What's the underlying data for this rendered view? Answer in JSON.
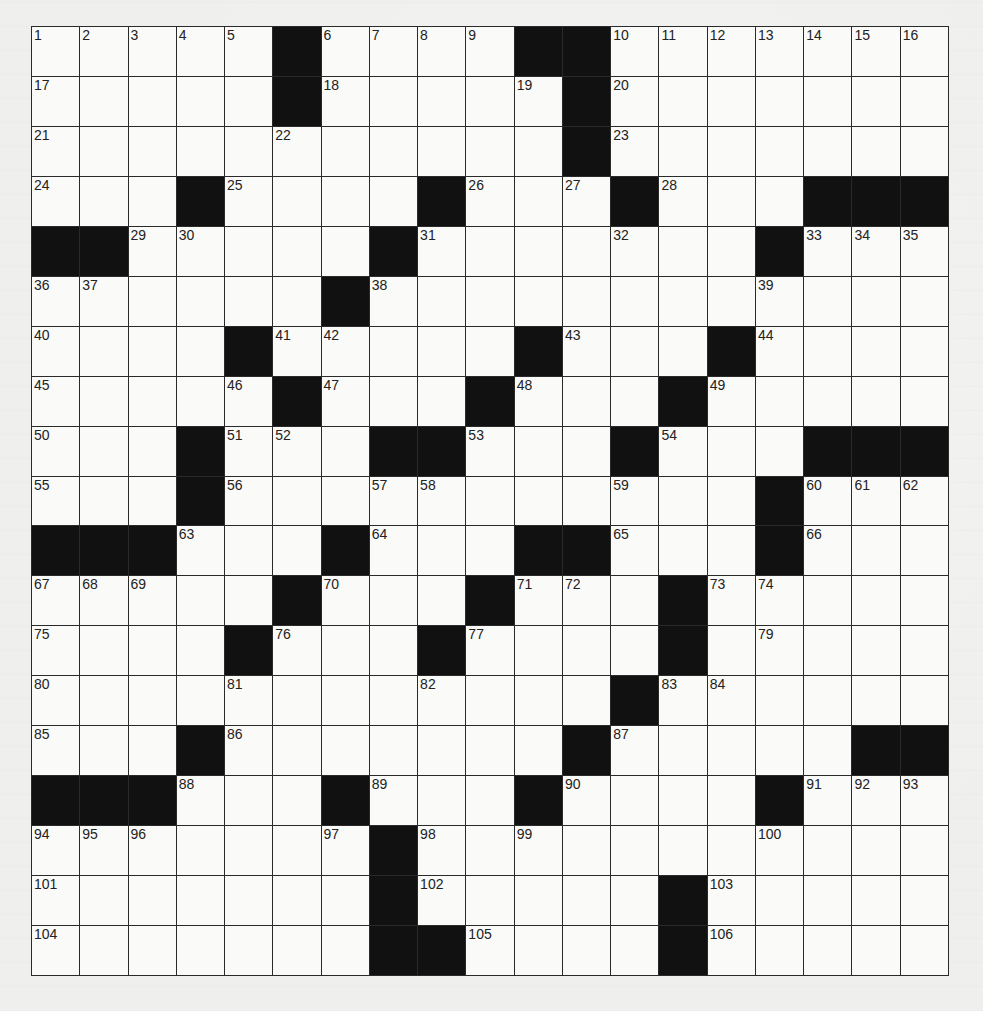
{
  "puzzle": {
    "rows": 19,
    "cols": 19,
    "colors": {
      "black": "#111111",
      "white": "#fafaf8",
      "line": "#2a2a2a"
    },
    "layout": [
      ".....#....##.......",
      ".....#.....#.......",
      "...........#.......",
      "...#....#...#...###",
      "##.....#.......#...",
      "......#............",
      "....#.....#...#....",
      ".....#...#...#.....",
      "...#...##...#...###",
      "...#...........#...",
      "###...#...##...#...",
      ".....#...#...#.....",
      "....#...#....#.....",
      "............#......",
      "...#.......#.....##",
      "###...#...#....#...",
      ".......#...........",
      ".......#.....#.....",
      ".......##....#....."
    ],
    "numbers": [
      {
        "r": 0,
        "c": 0,
        "n": 1
      },
      {
        "r": 0,
        "c": 1,
        "n": 2
      },
      {
        "r": 0,
        "c": 2,
        "n": 3
      },
      {
        "r": 0,
        "c": 3,
        "n": 4
      },
      {
        "r": 0,
        "c": 4,
        "n": 5
      },
      {
        "r": 0,
        "c": 6,
        "n": 6
      },
      {
        "r": 0,
        "c": 7,
        "n": 7
      },
      {
        "r": 0,
        "c": 8,
        "n": 8
      },
      {
        "r": 0,
        "c": 9,
        "n": 9
      },
      {
        "r": 0,
        "c": 12,
        "n": 10
      },
      {
        "r": 0,
        "c": 13,
        "n": 11
      },
      {
        "r": 0,
        "c": 14,
        "n": 12
      },
      {
        "r": 0,
        "c": 15,
        "n": 13
      },
      {
        "r": 0,
        "c": 16,
        "n": 14
      },
      {
        "r": 0,
        "c": 17,
        "n": 15
      },
      {
        "r": 0,
        "c": 18,
        "n": 16
      },
      {
        "r": 1,
        "c": 0,
        "n": 17
      },
      {
        "r": 1,
        "c": 6,
        "n": 18
      },
      {
        "r": 1,
        "c": 10,
        "n": 19
      },
      {
        "r": 1,
        "c": 12,
        "n": 20
      },
      {
        "r": 2,
        "c": 0,
        "n": 21
      },
      {
        "r": 2,
        "c": 5,
        "n": 22
      },
      {
        "r": 2,
        "c": 12,
        "n": 23
      },
      {
        "r": 3,
        "c": 0,
        "n": 24
      },
      {
        "r": 3,
        "c": 4,
        "n": 25
      },
      {
        "r": 3,
        "c": 9,
        "n": 26
      },
      {
        "r": 3,
        "c": 11,
        "n": 27
      },
      {
        "r": 3,
        "c": 13,
        "n": 28
      },
      {
        "r": 4,
        "c": 2,
        "n": 29
      },
      {
        "r": 4,
        "c": 3,
        "n": 30
      },
      {
        "r": 4,
        "c": 8,
        "n": 31
      },
      {
        "r": 4,
        "c": 12,
        "n": 32
      },
      {
        "r": 4,
        "c": 16,
        "n": 33
      },
      {
        "r": 4,
        "c": 17,
        "n": 34
      },
      {
        "r": 4,
        "c": 18,
        "n": 35
      },
      {
        "r": 5,
        "c": 0,
        "n": 36
      },
      {
        "r": 5,
        "c": 1,
        "n": 37
      },
      {
        "r": 5,
        "c": 7,
        "n": 38
      },
      {
        "r": 5,
        "c": 15,
        "n": 39
      },
      {
        "r": 6,
        "c": 0,
        "n": 40
      },
      {
        "r": 6,
        "c": 5,
        "n": 41
      },
      {
        "r": 6,
        "c": 6,
        "n": 42
      },
      {
        "r": 6,
        "c": 11,
        "n": 43
      },
      {
        "r": 6,
        "c": 15,
        "n": 44
      },
      {
        "r": 7,
        "c": 0,
        "n": 45
      },
      {
        "r": 7,
        "c": 4,
        "n": 46
      },
      {
        "r": 7,
        "c": 6,
        "n": 47
      },
      {
        "r": 7,
        "c": 10,
        "n": 48
      },
      {
        "r": 7,
        "c": 14,
        "n": 49
      },
      {
        "r": 8,
        "c": 0,
        "n": 50
      },
      {
        "r": 8,
        "c": 4,
        "n": 51
      },
      {
        "r": 8,
        "c": 5,
        "n": 52
      },
      {
        "r": 8,
        "c": 9,
        "n": 53
      },
      {
        "r": 8,
        "c": 13,
        "n": 54
      },
      {
        "r": 9,
        "c": 0,
        "n": 55
      },
      {
        "r": 9,
        "c": 4,
        "n": 56
      },
      {
        "r": 9,
        "c": 7,
        "n": 57
      },
      {
        "r": 9,
        "c": 8,
        "n": 58
      },
      {
        "r": 9,
        "c": 12,
        "n": 59
      },
      {
        "r": 9,
        "c": 16,
        "n": 60
      },
      {
        "r": 9,
        "c": 17,
        "n": 61
      },
      {
        "r": 9,
        "c": 18,
        "n": 62
      },
      {
        "r": 10,
        "c": 3,
        "n": 63
      },
      {
        "r": 10,
        "c": 7,
        "n": 64
      },
      {
        "r": 10,
        "c": 12,
        "n": 65
      },
      {
        "r": 10,
        "c": 16,
        "n": 66
      },
      {
        "r": 11,
        "c": 0,
        "n": 67
      },
      {
        "r": 11,
        "c": 1,
        "n": 68
      },
      {
        "r": 11,
        "c": 2,
        "n": 69
      },
      {
        "r": 11,
        "c": 6,
        "n": 70
      },
      {
        "r": 11,
        "c": 10,
        "n": 71
      },
      {
        "r": 11,
        "c": 11,
        "n": 72
      },
      {
        "r": 11,
        "c": 14,
        "n": 73
      },
      {
        "r": 11,
        "c": 15,
        "n": 74
      },
      {
        "r": 12,
        "c": 0,
        "n": 75
      },
      {
        "r": 12,
        "c": 5,
        "n": 76
      },
      {
        "r": 12,
        "c": 9,
        "n": 77
      },
      {
        "r": 12,
        "c": 13,
        "n": 78
      },
      {
        "r": 12,
        "c": 15,
        "n": 79
      },
      {
        "r": 13,
        "c": 0,
        "n": 80
      },
      {
        "r": 13,
        "c": 4,
        "n": 81
      },
      {
        "r": 13,
        "c": 8,
        "n": 82
      },
      {
        "r": 13,
        "c": 13,
        "n": 83
      },
      {
        "r": 13,
        "c": 14,
        "n": 84
      },
      {
        "r": 14,
        "c": 0,
        "n": 85
      },
      {
        "r": 14,
        "c": 4,
        "n": 86
      },
      {
        "r": 14,
        "c": 12,
        "n": 87
      },
      {
        "r": 15,
        "c": 3,
        "n": 88
      },
      {
        "r": 15,
        "c": 7,
        "n": 89
      },
      {
        "r": 15,
        "c": 11,
        "n": 90
      },
      {
        "r": 15,
        "c": 16,
        "n": 91
      },
      {
        "r": 15,
        "c": 17,
        "n": 92
      },
      {
        "r": 15,
        "c": 18,
        "n": 93
      },
      {
        "r": 16,
        "c": 0,
        "n": 94
      },
      {
        "r": 16,
        "c": 1,
        "n": 95
      },
      {
        "r": 16,
        "c": 2,
        "n": 96
      },
      {
        "r": 16,
        "c": 6,
        "n": 97
      },
      {
        "r": 16,
        "c": 8,
        "n": 98
      },
      {
        "r": 16,
        "c": 10,
        "n": 99
      },
      {
        "r": 16,
        "c": 15,
        "n": 100
      },
      {
        "r": 17,
        "c": 0,
        "n": 101
      },
      {
        "r": 17,
        "c": 8,
        "n": 102
      },
      {
        "r": 17,
        "c": 14,
        "n": 103
      },
      {
        "r": 18,
        "c": 0,
        "n": 104
      },
      {
        "r": 18,
        "c": 9,
        "n": 105
      },
      {
        "r": 18,
        "c": 14,
        "n": 106
      }
    ]
  }
}
